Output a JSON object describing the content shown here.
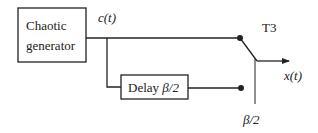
{
  "diagram": {
    "blocks": {
      "generator": {
        "line1": "Chaotic",
        "line2": "generator"
      },
      "delay": {
        "label": "Delay ",
        "param": "β/2"
      }
    },
    "signals": {
      "input": "c(t)",
      "output": "x(t)"
    },
    "switch": {
      "label": "T3",
      "control": "β/2"
    },
    "colors": {
      "stroke": "#222222",
      "background": "#ffffff"
    }
  }
}
